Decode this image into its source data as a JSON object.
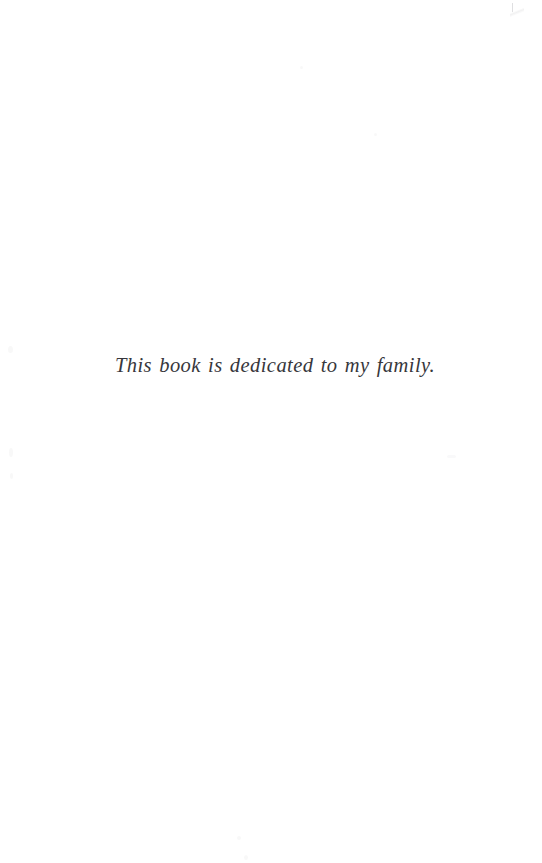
{
  "page": {
    "background_color": "#ffffff",
    "text_color": "#2b2b30",
    "type": "book-dedication-page"
  },
  "dedication": {
    "text": "This book is dedicated to my family."
  }
}
